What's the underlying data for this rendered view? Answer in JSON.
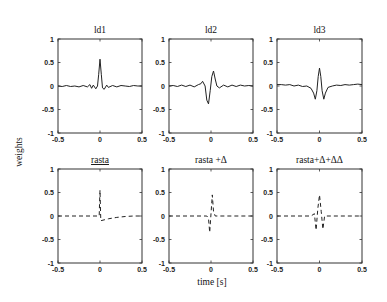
{
  "figure": {
    "ylabel": "weights",
    "xlabel": "time [s]"
  },
  "chart_data": [
    {
      "type": "line",
      "title": "ld1",
      "xlim": [
        -0.5,
        0.5
      ],
      "ylim": [
        -1,
        1
      ],
      "xticks": [
        -0.5,
        0,
        0.5
      ],
      "yticks": [
        1,
        0.5,
        0,
        -0.5,
        -1
      ],
      "xtick_labels": [
        "-0.5",
        "0",
        "0.5"
      ],
      "ytick_labels": [
        "1",
        "0.5",
        "0",
        "-0.5",
        "-1"
      ],
      "line_style": "solid",
      "series": [
        {
          "name": "ld1",
          "x": [
            -0.5,
            -0.45,
            -0.4,
            -0.35,
            -0.3,
            -0.25,
            -0.2,
            -0.15,
            -0.12,
            -0.1,
            -0.08,
            -0.05,
            -0.03,
            -0.015,
            0,
            0.015,
            0.03,
            0.05,
            0.08,
            0.1,
            0.15,
            0.2,
            0.25,
            0.3,
            0.35,
            0.4,
            0.45,
            0.5
          ],
          "y": [
            0,
            -0.01,
            0.01,
            -0.01,
            0.0,
            -0.02,
            0.01,
            -0.02,
            0.03,
            -0.05,
            0.02,
            -0.06,
            0.0,
            0.25,
            0.57,
            0.25,
            -0.04,
            -0.07,
            0.02,
            -0.03,
            0.01,
            -0.02,
            0.01,
            0.0,
            -0.01,
            0.01,
            0.0,
            0.0
          ]
        }
      ]
    },
    {
      "type": "line",
      "title": "ld2",
      "xlim": [
        -0.5,
        0.5
      ],
      "ylim": [
        -1,
        1
      ],
      "xticks": [
        -0.5,
        0,
        0.5
      ],
      "yticks": [
        1,
        0.5,
        0,
        -0.5,
        -1
      ],
      "xtick_labels": [
        "-0.5",
        "0",
        "0.5"
      ],
      "ytick_labels": [
        "1",
        "0.5",
        "0",
        "-0.5",
        "-1"
      ],
      "line_style": "solid",
      "series": [
        {
          "name": "ld2",
          "x": [
            -0.5,
            -0.45,
            -0.4,
            -0.35,
            -0.3,
            -0.25,
            -0.2,
            -0.15,
            -0.12,
            -0.1,
            -0.07,
            -0.05,
            -0.03,
            -0.01,
            0.01,
            0.03,
            0.05,
            0.07,
            0.1,
            0.15,
            0.2,
            0.25,
            0.3,
            0.35,
            0.4,
            0.45,
            0.5
          ],
          "y": [
            0,
            0.01,
            -0.01,
            0.02,
            -0.01,
            0.02,
            -0.02,
            0.03,
            0.05,
            0.1,
            0.0,
            -0.3,
            -0.38,
            -0.1,
            0.2,
            0.32,
            0.15,
            0.0,
            -0.04,
            0.02,
            -0.02,
            0.02,
            -0.01,
            0.02,
            0.0,
            0.01,
            0.0
          ]
        }
      ]
    },
    {
      "type": "line",
      "title": "ld3",
      "xlim": [
        -0.5,
        0.5
      ],
      "ylim": [
        -1,
        1
      ],
      "xticks": [
        -0.5,
        0,
        0.5
      ],
      "yticks": [
        1,
        0.5,
        0,
        -0.5,
        -1
      ],
      "xtick_labels": [
        "-0.5",
        "0",
        "0.5"
      ],
      "ytick_labels": [
        "1",
        "0.5",
        "0",
        "-0.5",
        "-1"
      ],
      "line_style": "solid",
      "series": [
        {
          "name": "ld3",
          "x": [
            -0.5,
            -0.45,
            -0.4,
            -0.35,
            -0.3,
            -0.25,
            -0.2,
            -0.15,
            -0.1,
            -0.07,
            -0.05,
            -0.03,
            -0.015,
            0,
            0.015,
            0.03,
            0.05,
            0.07,
            0.1,
            0.15,
            0.2,
            0.25,
            0.3,
            0.35,
            0.4,
            0.45,
            0.5
          ],
          "y": [
            0.03,
            0.03,
            0.02,
            0.03,
            0.0,
            0.02,
            -0.01,
            0.0,
            -0.05,
            -0.15,
            -0.28,
            -0.1,
            0.2,
            0.38,
            0.2,
            -0.1,
            -0.28,
            -0.15,
            -0.03,
            0.0,
            0.02,
            0.01,
            0.03,
            0.02,
            0.03,
            0.04,
            0.03
          ]
        }
      ]
    },
    {
      "type": "line",
      "title": "rasta",
      "xlim": [
        -0.5,
        0.5
      ],
      "ylim": [
        -1,
        1
      ],
      "xticks": [
        -0.5,
        0,
        0.5
      ],
      "yticks": [
        1,
        0.5,
        0,
        -0.5,
        -1
      ],
      "xtick_labels": [
        "-0.5",
        "0",
        "0.5"
      ],
      "ytick_labels": [
        "1",
        "0.5",
        "0",
        "-0.5",
        "-1"
      ],
      "line_style": "dashed",
      "series": [
        {
          "name": "rasta",
          "x": [
            -0.5,
            -0.01,
            -0.005,
            0,
            0.005,
            0.01,
            0.1,
            0.2,
            0.3,
            0.4,
            0.5
          ],
          "y": [
            0,
            0,
            0.3,
            0.55,
            0.2,
            -0.1,
            -0.06,
            -0.03,
            -0.01,
            0,
            0
          ]
        }
      ]
    },
    {
      "type": "line",
      "title": "rasta +Δ",
      "xlim": [
        -0.5,
        0.5
      ],
      "ylim": [
        -1,
        1
      ],
      "xticks": [
        -0.5,
        0,
        0.5
      ],
      "yticks": [
        1,
        0.5,
        0,
        -0.5,
        -1
      ],
      "xtick_labels": [
        "-0.5",
        "0",
        "0.5"
      ],
      "ytick_labels": [
        "1",
        "0.5",
        "0",
        "-0.5",
        "-1"
      ],
      "line_style": "dashed",
      "series": [
        {
          "name": "rasta +Δ",
          "x": [
            -0.5,
            -0.1,
            -0.05,
            -0.03,
            -0.015,
            0,
            0.015,
            0.03,
            0.05,
            0.1,
            0.5
          ],
          "y": [
            0,
            0,
            0,
            -0.05,
            -0.35,
            0.05,
            0.45,
            0.1,
            0.0,
            0,
            0
          ]
        }
      ]
    },
    {
      "type": "line",
      "title": "rasta+Δ+ΔΔ",
      "xlim": [
        -0.5,
        0.5
      ],
      "ylim": [
        -1,
        1
      ],
      "xticks": [
        -0.5,
        0,
        0.5
      ],
      "yticks": [
        1,
        0.5,
        0,
        -0.5,
        -1
      ],
      "xtick_labels": [
        "-0.5",
        "0",
        "0.5"
      ],
      "ytick_labels": [
        "1",
        "0.5",
        "0",
        "-0.5",
        "-1"
      ],
      "line_style": "dashed",
      "series": [
        {
          "name": "rasta+Δ+ΔΔ",
          "x": [
            -0.5,
            -0.1,
            -0.06,
            -0.04,
            -0.02,
            0,
            0.02,
            0.04,
            0.06,
            0.1,
            0.5
          ],
          "y": [
            0,
            0,
            0.05,
            -0.3,
            0.15,
            0.45,
            0.1,
            -0.28,
            0.0,
            0,
            0
          ]
        }
      ]
    }
  ]
}
